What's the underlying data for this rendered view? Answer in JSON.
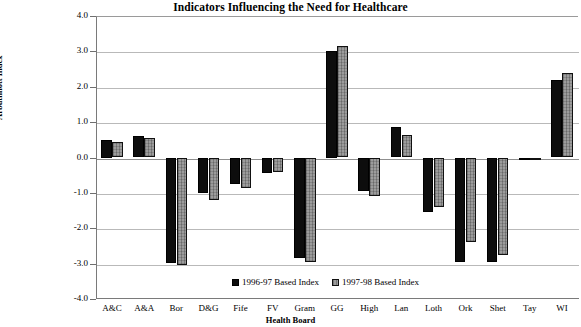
{
  "chart_data": {
    "type": "bar",
    "title": "Indicators Influencing the Need for Healthcare",
    "xlabel": "Health Board",
    "ylabel": "Arbuthnott Index",
    "ylim": [
      -4.0,
      4.0
    ],
    "ytick_step": 1.0,
    "yticks": [
      "4.0",
      "3.0",
      "2.0",
      "1.0",
      "0.0",
      "-1.0",
      "-2.0",
      "-3.0",
      "-4.0"
    ],
    "grid": true,
    "legend_position": "bottom-right",
    "categories": [
      "A&C",
      "A&A",
      "Bor",
      "D&G",
      "Fife",
      "FV",
      "Gram",
      "GG",
      "High",
      "Lan",
      "Loth",
      "Ork",
      "Shet",
      "Tay",
      "WI"
    ],
    "series": [
      {
        "name": "1996-97 Based Index",
        "color": "#0d0d0d",
        "values": [
          0.5,
          0.6,
          -2.98,
          -1.0,
          -0.75,
          -0.45,
          -2.85,
          3.0,
          -0.95,
          0.85,
          -1.55,
          -2.95,
          -2.95,
          -0.05,
          2.2
        ]
      },
      {
        "name": "1997-98 Based Index",
        "color": "#9c9c9c",
        "values": [
          0.45,
          0.55,
          -3.05,
          -1.2,
          -0.85,
          -0.4,
          -2.95,
          3.15,
          -1.1,
          0.65,
          -1.4,
          -2.4,
          -2.75,
          -0.05,
          2.4
        ]
      }
    ]
  },
  "legend": {
    "items": [
      {
        "label": "1996-97 Based Index"
      },
      {
        "label": "1997-98 Based Index"
      }
    ]
  }
}
